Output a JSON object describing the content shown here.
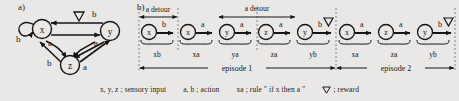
{
  "panels": {
    "a": {
      "tag": "a)"
    },
    "b": {
      "tag": "b)"
    }
  },
  "graph": {
    "nodes": [
      {
        "id": "x",
        "label": "x"
      },
      {
        "id": "y",
        "label": "y"
      },
      {
        "id": "z",
        "label": "z"
      }
    ],
    "edges": [
      {
        "from": "x",
        "to": "x",
        "label": "b",
        "kind": "self-loop"
      },
      {
        "from": "y",
        "to": "x",
        "label": "b",
        "kind": "rewarded"
      },
      {
        "from": "x",
        "to": "y",
        "label": "a",
        "kind": "normal"
      },
      {
        "from": "y",
        "to": "z",
        "label": "a",
        "kind": "normal"
      },
      {
        "from": "x",
        "to": "z",
        "label": "a",
        "kind": "normal"
      },
      {
        "from": "z",
        "to": "x",
        "label": "b",
        "kind": "normal"
      },
      {
        "from": "z",
        "to": "y",
        "label": "a",
        "kind": "normal"
      }
    ],
    "reward_marker": "reward-triangle"
  },
  "sequence": {
    "steps": [
      {
        "state": "x",
        "action": "b",
        "rule": "xb",
        "reward": false
      },
      {
        "state": "x",
        "action": "a",
        "rule": "xa",
        "reward": false
      },
      {
        "state": "y",
        "action": "a",
        "rule": "ya",
        "reward": false
      },
      {
        "state": "z",
        "action": "a",
        "rule": "za",
        "reward": false
      },
      {
        "state": "y",
        "action": "b",
        "rule": "yb",
        "reward": true
      },
      {
        "state": "x",
        "action": "a",
        "rule": "xa",
        "reward": false
      },
      {
        "state": "z",
        "action": "a",
        "rule": "za",
        "reward": false
      },
      {
        "state": "y",
        "action": "b",
        "rule": "yb",
        "reward": true
      }
    ],
    "detours": [
      {
        "label": "a detour",
        "from_step": 0,
        "to_step": 1
      },
      {
        "label": "a detour",
        "from_step": 2,
        "to_step": 4
      }
    ],
    "episodes": [
      {
        "label": "episode 1",
        "from_step": 0,
        "to_step": 4
      },
      {
        "label": "episode 2",
        "from_step": 5,
        "to_step": 7
      }
    ]
  },
  "legend": {
    "sensory": "x, y, z ; sensory input",
    "action": "a, b ; action",
    "rule": "xa ; rule \" if x then a \"",
    "reward": "; reward"
  },
  "colors": {
    "background": "#e9e8e6",
    "ink": "#161616"
  }
}
